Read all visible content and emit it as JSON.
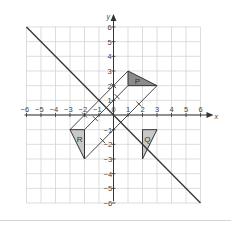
{
  "diagram": {
    "type": "coordinate-grid-reflection",
    "axes": {
      "x_label": "x",
      "y_label": "y",
      "x_range": [
        -6,
        6
      ],
      "y_range": [
        -6,
        6
      ],
      "x_ticks": [
        "-6",
        "-5",
        "-4",
        "-3",
        "-2",
        "-1",
        "0",
        "1",
        "2",
        "3",
        "4",
        "5",
        "6"
      ],
      "y_ticks": [
        "-6",
        "-5",
        "-4",
        "-3",
        "-2",
        "-1",
        "1",
        "2",
        "3",
        "4",
        "5",
        "6"
      ]
    },
    "mirror_line": {
      "equation": "y = -x",
      "from": [
        -6,
        6
      ],
      "to": [
        6,
        -6
      ]
    },
    "shapes": [
      {
        "label": "P",
        "vertices": [
          [
            1,
            3
          ],
          [
            1,
            2
          ],
          [
            3,
            2
          ]
        ],
        "fill": "#8c8c8c"
      },
      {
        "label": "Q",
        "vertices": [
          [
            2,
            -1
          ],
          [
            3,
            -1
          ],
          [
            2,
            -3
          ]
        ],
        "fill": "#c8c8c8"
      },
      {
        "label": "R",
        "vertices": [
          [
            -3,
            -1
          ],
          [
            -2,
            -1
          ],
          [
            -2,
            -3
          ]
        ],
        "fill": "#c8c8c8"
      }
    ],
    "construction_lines": [
      {
        "from": [
          1,
          3
        ],
        "to": [
          -3,
          -1
        ]
      },
      {
        "from": [
          1,
          2
        ],
        "to": [
          -2,
          -1
        ]
      },
      {
        "from": [
          3,
          2
        ],
        "to": [
          -2,
          -3
        ]
      }
    ],
    "colors": {
      "grid": "#d4d4d4",
      "axis": "#333333",
      "line": "#333333"
    }
  }
}
